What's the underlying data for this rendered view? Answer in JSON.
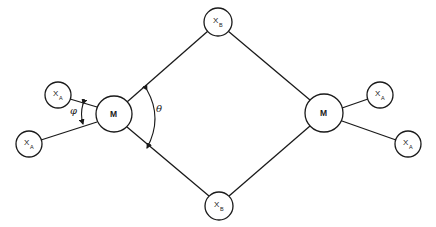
{
  "diagram": {
    "colors": {
      "stroke": "#1a1a1a",
      "background": "#ffffff"
    },
    "nodes": [
      {
        "id": "M_left",
        "label": "M",
        "sub": "",
        "cx": 114,
        "cy": 114,
        "r": 18
      },
      {
        "id": "M_right",
        "label": "M",
        "sub": "",
        "cx": 324,
        "cy": 113,
        "r": 19
      },
      {
        "id": "XB_top",
        "label": "X",
        "sub": "B",
        "cx": 218,
        "cy": 22,
        "r": 14
      },
      {
        "id": "XB_bottom",
        "label": "X",
        "sub": "B",
        "cx": 219,
        "cy": 206,
        "r": 14
      },
      {
        "id": "XA_left_upper",
        "label": "X",
        "sub": "A",
        "cx": 58,
        "cy": 95,
        "r": 13
      },
      {
        "id": "XA_left_lower",
        "label": "X",
        "sub": "A",
        "cx": 29,
        "cy": 144,
        "r": 13
      },
      {
        "id": "XA_right_upper",
        "label": "X",
        "sub": "A",
        "cx": 380,
        "cy": 95,
        "r": 13
      },
      {
        "id": "XA_right_lower",
        "label": "X",
        "sub": "A",
        "cx": 408,
        "cy": 144,
        "r": 13
      }
    ],
    "angles": {
      "theta": {
        "label": "θ"
      },
      "phi": {
        "label": "φ"
      }
    }
  }
}
